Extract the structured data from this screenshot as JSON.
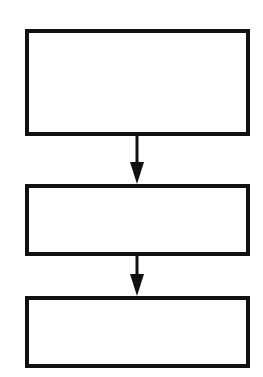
{
  "diagram": {
    "type": "flowchart",
    "boxes": [
      {
        "id": "box-1",
        "label": ""
      },
      {
        "id": "box-2",
        "label": ""
      },
      {
        "id": "box-3",
        "label": ""
      }
    ],
    "edges": [
      {
        "from": "box-1",
        "to": "box-2"
      },
      {
        "from": "box-2",
        "to": "box-3"
      }
    ],
    "colors": {
      "stroke": "#111111",
      "fill": "#ffffff"
    }
  }
}
